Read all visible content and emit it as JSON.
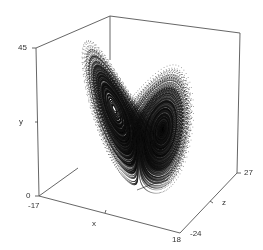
{
  "chart_data": {
    "type": "scatter",
    "subtype": "3d-scatter",
    "title": "",
    "series": [
      {
        "name": "lorenz trajectory",
        "color": "#111111",
        "params": {
          "sigma": 10,
          "rho": 28,
          "beta": 2.6667
        }
      }
    ],
    "axes": {
      "x": {
        "label": "x",
        "ticks": [
          "-17",
          "18"
        ],
        "range": [
          -17,
          18
        ]
      },
      "y": {
        "label": "y",
        "ticks": [
          "0",
          "45"
        ],
        "range": [
          0,
          45
        ]
      },
      "z": {
        "label": "z",
        "ticks": [
          "-24",
          "27"
        ],
        "range": [
          -24,
          27
        ]
      }
    },
    "grid": false,
    "legend": null
  },
  "labels": {
    "y_top": "45",
    "y_bottom": "0",
    "y_name": "y",
    "x_left": "-17",
    "x_right": "18",
    "x_name": "x",
    "z_back": "27",
    "z_front": "-24",
    "z_name": "z"
  },
  "colors": {
    "axis": "#555555",
    "points": "#111111",
    "background": "#ffffff"
  }
}
